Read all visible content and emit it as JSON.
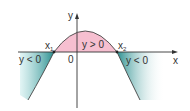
{
  "diagram": {
    "type": "parabola-sign-diagram",
    "axes": {
      "x_label": "x",
      "y_label": "y",
      "origin_label": "0"
    },
    "roots": [
      {
        "label": "x",
        "subscript": "1"
      },
      {
        "label": "x",
        "subscript": "2"
      }
    ],
    "regions": {
      "positive": {
        "text": "y > 0",
        "color": "#f4b8c8"
      },
      "negative_left": {
        "text": "y < 0",
        "color": "#2e9c9c"
      },
      "negative_right": {
        "text": "y < 0",
        "color": "#2e9c9c"
      }
    },
    "curve_color": "#333333",
    "axis_color": "#333333"
  }
}
